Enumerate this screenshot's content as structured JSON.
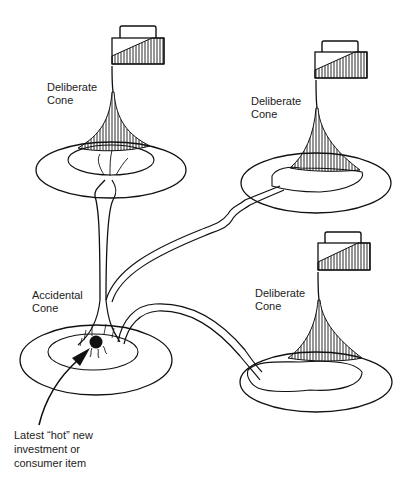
{
  "diagram": {
    "type": "cone illustration",
    "cones": [
      {
        "id": "top-left",
        "label_line1": "Deliberate",
        "label_line2": "Cone",
        "kind": "deliberate"
      },
      {
        "id": "top-right",
        "label_line1": "Deliberate",
        "label_line2": "Cone",
        "kind": "deliberate"
      },
      {
        "id": "bottom-right",
        "label_line1": "Deliberate",
        "label_line2": "Cone",
        "kind": "deliberate"
      },
      {
        "id": "accidental",
        "label_line1": "Accidental",
        "label_line2": "Cone",
        "kind": "accidental"
      }
    ],
    "callout": {
      "line1": "Latest “hot” new",
      "line2": "investment or",
      "line3": "consumer item"
    },
    "colors": {
      "ink": "#111111",
      "background": "#ffffff"
    }
  }
}
